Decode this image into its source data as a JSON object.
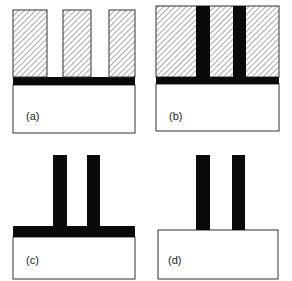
{
  "figure": {
    "panels": [
      {
        "id": "a",
        "label": "(a)"
      },
      {
        "id": "b",
        "label": "(b)"
      },
      {
        "id": "c",
        "label": "(c)"
      },
      {
        "id": "d",
        "label": "(d)"
      }
    ],
    "colors": {
      "fill_black": "#0a0a0a",
      "outline": "#333333",
      "hatch": "#555555",
      "background": "#ffffff"
    }
  }
}
